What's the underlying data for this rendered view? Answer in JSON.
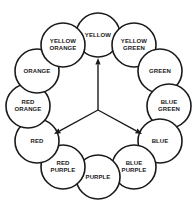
{
  "figure": {
    "name": "color-wheel",
    "type": "diagram",
    "background_color": "#ffffff",
    "ink_color": "#1a1a1a",
    "width": 196,
    "height": 214
  },
  "wheel": {
    "center_x": 98,
    "center_y": 106,
    "ring_radius": 71,
    "swatch_radius": 22,
    "swatches": [
      {
        "id": "yellow",
        "label": "YELLOW",
        "angle_deg": 0,
        "cx": 98,
        "cy": 35,
        "primary": true
      },
      {
        "id": "yellow-green",
        "label": "YELLOW\nGREEN",
        "angle_deg": 30,
        "cx": 134,
        "cy": 45,
        "primary": false
      },
      {
        "id": "green",
        "label": "GREEN",
        "angle_deg": 60,
        "cx": 160,
        "cy": 71,
        "primary": false
      },
      {
        "id": "blue-green",
        "label": "BLUE\nGREEN",
        "angle_deg": 90,
        "cx": 169,
        "cy": 106,
        "primary": false
      },
      {
        "id": "blue",
        "label": "BLUE",
        "angle_deg": 120,
        "cx": 160,
        "cy": 141,
        "primary": true
      },
      {
        "id": "blue-purple",
        "label": "BLUE\nPURPLE",
        "angle_deg": 150,
        "cx": 134,
        "cy": 167,
        "primary": false
      },
      {
        "id": "purple",
        "label": "PURPLE",
        "angle_deg": 180,
        "cx": 98,
        "cy": 177,
        "primary": false
      },
      {
        "id": "red-purple",
        "label": "RED\nPURPLE",
        "angle_deg": 210,
        "cx": 63,
        "cy": 167,
        "primary": false
      },
      {
        "id": "red",
        "label": "RED",
        "angle_deg": 240,
        "cx": 37,
        "cy": 141,
        "primary": true
      },
      {
        "id": "red-orange",
        "label": "RED\nORANGE",
        "angle_deg": 270,
        "cx": 28,
        "cy": 106,
        "primary": false
      },
      {
        "id": "orange",
        "label": "ORANGE",
        "angle_deg": 300,
        "cx": 37,
        "cy": 71,
        "primary": false
      },
      {
        "id": "yellow-orange",
        "label": "YELLOW\nORANGE",
        "angle_deg": 330,
        "cx": 63,
        "cy": 45,
        "primary": false
      }
    ]
  },
  "hub": {
    "x": 98,
    "y": 110,
    "arrows": [
      {
        "id": "arrow-to-yellow",
        "target": "yellow",
        "tip_x": 98,
        "tip_y": 58,
        "direction": "up"
      },
      {
        "id": "arrow-to-red",
        "target": "red",
        "tip_x": 54,
        "tip_y": 134,
        "direction": "down-left"
      },
      {
        "id": "arrow-to-blue",
        "target": "blue",
        "tip_x": 142,
        "tip_y": 134,
        "direction": "down-right"
      }
    ]
  }
}
